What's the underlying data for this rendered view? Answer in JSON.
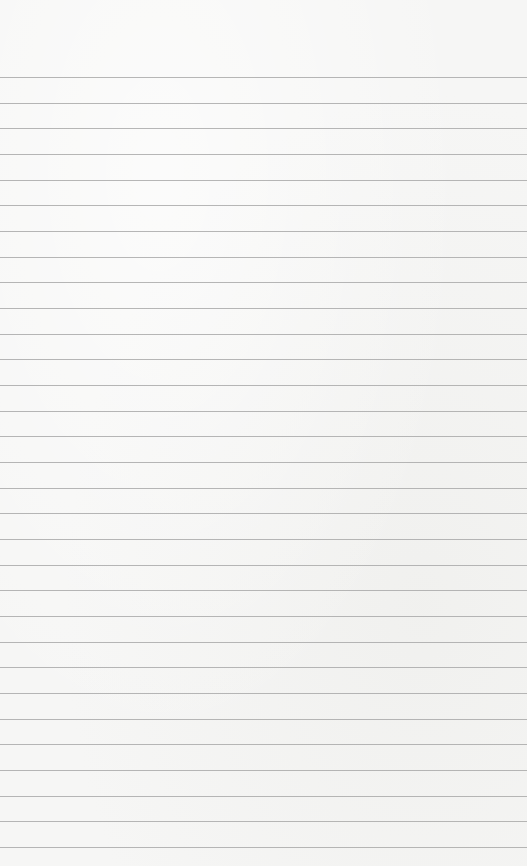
{
  "page": {
    "type": "lined-paper",
    "background_color": "#f6f6f5",
    "rule_color": "#a9a9a9",
    "first_rule_y": 77,
    "rule_spacing": 25.67,
    "rule_count": 31
  }
}
